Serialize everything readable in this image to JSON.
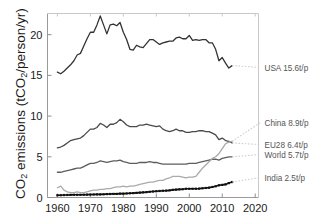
{
  "chart_data": {
    "type": "line",
    "title": "",
    "xlabel": "",
    "ylabel": "CO2 emissions (tCO2/person/yr)",
    "ylabel_parts": {
      "pre": "CO",
      "sub1": "2",
      "mid": " emissions (tCO",
      "sub2": "2",
      "post": "/person/yr)"
    },
    "xlim": [
      1957,
      2021
    ],
    "ylim": [
      0,
      22.6
    ],
    "xticks": [
      1960,
      1970,
      1980,
      1990,
      2000,
      2010,
      2020
    ],
    "yticks": [
      0,
      5,
      10,
      15,
      20
    ],
    "grid": false,
    "legend_position": "right-inline-labels",
    "series": [
      {
        "name": "USA",
        "label": "USA 15.6t/p",
        "color": "#333333",
        "end_value": 15.6,
        "x": [
          1960,
          1961,
          1962,
          1963,
          1964,
          1965,
          1966,
          1967,
          1968,
          1969,
          1970,
          1971,
          1972,
          1973,
          1974,
          1975,
          1976,
          1977,
          1978,
          1979,
          1980,
          1981,
          1982,
          1983,
          1984,
          1985,
          1986,
          1987,
          1988,
          1989,
          1990,
          1991,
          1992,
          1993,
          1994,
          1995,
          1996,
          1997,
          1998,
          1999,
          2000,
          2001,
          2002,
          2003,
          2004,
          2005,
          2006,
          2007,
          2008,
          2009,
          2010,
          2011,
          2012,
          2013
        ],
        "values": [
          15.4,
          15.2,
          15.5,
          15.9,
          16.3,
          16.8,
          17.5,
          17.7,
          18.6,
          19.5,
          20.3,
          20.3,
          21.2,
          22.3,
          21.2,
          20.1,
          21.2,
          21.3,
          21.1,
          21.5,
          20.3,
          19.4,
          18.2,
          18.1,
          18.7,
          18.5,
          18.4,
          18.9,
          19.4,
          19.4,
          19.1,
          18.8,
          19.0,
          19.1,
          19.2,
          19.2,
          19.6,
          19.7,
          19.5,
          19.5,
          19.9,
          19.3,
          19.4,
          19.3,
          19.4,
          19.4,
          19.0,
          19.0,
          18.2,
          16.8,
          17.2,
          16.5,
          15.9,
          16.2
        ]
      },
      {
        "name": "EU28",
        "label": "EU28 6.4t/p",
        "color": "#4a4a4a",
        "end_value": 6.4,
        "x": [
          1960,
          1961,
          1962,
          1963,
          1964,
          1965,
          1966,
          1967,
          1968,
          1969,
          1970,
          1971,
          1972,
          1973,
          1974,
          1975,
          1976,
          1977,
          1978,
          1979,
          1980,
          1981,
          1982,
          1983,
          1984,
          1985,
          1986,
          1987,
          1988,
          1989,
          1990,
          1991,
          1992,
          1993,
          1994,
          1995,
          1996,
          1997,
          1998,
          1999,
          2000,
          2001,
          2002,
          2003,
          2004,
          2005,
          2006,
          2007,
          2008,
          2009,
          2010,
          2011,
          2012,
          2013
        ],
        "values": [
          6.1,
          6.2,
          6.4,
          6.7,
          7.0,
          7.1,
          7.2,
          7.3,
          7.6,
          8.0,
          8.4,
          8.4,
          8.6,
          9.1,
          8.9,
          8.6,
          9.0,
          9.0,
          9.2,
          9.6,
          9.3,
          8.9,
          8.7,
          8.7,
          8.7,
          8.9,
          8.9,
          9.0,
          8.9,
          8.8,
          8.7,
          8.8,
          8.4,
          8.2,
          8.1,
          8.2,
          8.4,
          8.2,
          8.2,
          8.0,
          8.0,
          8.1,
          8.1,
          8.2,
          8.2,
          8.1,
          8.1,
          7.9,
          7.7,
          7.1,
          7.3,
          7.0,
          6.9,
          6.7
        ]
      },
      {
        "name": "World",
        "label": "World 5.7t/p",
        "color": "#5d5d5d",
        "end_value": 5.7,
        "x": [
          1960,
          1961,
          1962,
          1963,
          1964,
          1965,
          1966,
          1967,
          1968,
          1969,
          1970,
          1971,
          1972,
          1973,
          1974,
          1975,
          1976,
          1977,
          1978,
          1979,
          1980,
          1981,
          1982,
          1983,
          1984,
          1985,
          1986,
          1987,
          1988,
          1989,
          1990,
          1991,
          1992,
          1993,
          1994,
          1995,
          1996,
          1997,
          1998,
          1999,
          2000,
          2001,
          2002,
          2003,
          2004,
          2005,
          2006,
          2007,
          2008,
          2009,
          2010,
          2011,
          2012,
          2013
        ],
        "values": [
          3.1,
          3.1,
          3.2,
          3.3,
          3.4,
          3.5,
          3.6,
          3.6,
          3.8,
          4.0,
          4.2,
          4.2,
          4.3,
          4.5,
          4.4,
          4.3,
          4.4,
          4.5,
          4.5,
          4.6,
          4.4,
          4.3,
          4.2,
          4.2,
          4.2,
          4.3,
          4.3,
          4.3,
          4.4,
          4.3,
          4.3,
          4.2,
          4.1,
          4.1,
          4.1,
          4.1,
          4.1,
          4.1,
          4.1,
          4.1,
          4.2,
          4.2,
          4.2,
          4.3,
          4.4,
          4.5,
          4.6,
          4.7,
          4.7,
          4.6,
          4.8,
          4.9,
          5.0,
          5.0
        ]
      },
      {
        "name": "China",
        "label": "China 8.9t/p",
        "color": "#aaaaaa",
        "end_value": 8.9,
        "x": [
          1960,
          1961,
          1962,
          1963,
          1964,
          1965,
          1966,
          1967,
          1968,
          1969,
          1970,
          1971,
          1972,
          1973,
          1974,
          1975,
          1976,
          1977,
          1978,
          1979,
          1980,
          1981,
          1982,
          1983,
          1984,
          1985,
          1986,
          1987,
          1988,
          1989,
          1990,
          1991,
          1992,
          1993,
          1994,
          1995,
          1996,
          1997,
          1998,
          1999,
          2000,
          2001,
          2002,
          2003,
          2004,
          2005,
          2006,
          2007,
          2008,
          2009,
          2010,
          2011,
          2012,
          2013
        ],
        "values": [
          1.2,
          1.4,
          0.9,
          0.7,
          0.6,
          0.6,
          0.7,
          0.6,
          0.6,
          0.7,
          0.8,
          0.9,
          0.9,
          1.0,
          1.0,
          1.1,
          1.1,
          1.2,
          1.3,
          1.3,
          1.4,
          1.3,
          1.4,
          1.4,
          1.5,
          1.6,
          1.7,
          1.8,
          1.9,
          1.9,
          2.0,
          2.1,
          2.1,
          2.3,
          2.4,
          2.6,
          2.6,
          2.6,
          2.5,
          2.4,
          2.5,
          2.5,
          2.6,
          3.1,
          3.6,
          4.0,
          4.4,
          4.8,
          5.0,
          5.4,
          6.0,
          6.6,
          6.8,
          6.9
        ]
      },
      {
        "name": "India",
        "label": "India 2.5t/p",
        "color": "#111111",
        "end_value": 2.5,
        "markers": true,
        "x": [
          1960,
          1961,
          1962,
          1963,
          1964,
          1965,
          1966,
          1967,
          1968,
          1969,
          1970,
          1971,
          1972,
          1973,
          1974,
          1975,
          1976,
          1977,
          1978,
          1979,
          1980,
          1981,
          1982,
          1983,
          1984,
          1985,
          1986,
          1987,
          1988,
          1989,
          1990,
          1991,
          1992,
          1993,
          1994,
          1995,
          1996,
          1997,
          1998,
          1999,
          2000,
          2001,
          2002,
          2003,
          2004,
          2005,
          2006,
          2007,
          2008,
          2009,
          2010,
          2011,
          2012,
          2013
        ],
        "values": [
          0.27,
          0.28,
          0.3,
          0.31,
          0.32,
          0.33,
          0.33,
          0.33,
          0.34,
          0.35,
          0.36,
          0.37,
          0.38,
          0.38,
          0.39,
          0.42,
          0.43,
          0.44,
          0.44,
          0.47,
          0.47,
          0.5,
          0.52,
          0.54,
          0.57,
          0.6,
          0.63,
          0.66,
          0.7,
          0.74,
          0.77,
          0.8,
          0.83,
          0.85,
          0.88,
          0.94,
          0.97,
          1.0,
          1.02,
          1.07,
          1.07,
          1.07,
          1.08,
          1.09,
          1.13,
          1.17,
          1.21,
          1.29,
          1.38,
          1.5,
          1.55,
          1.61,
          1.77,
          1.9
        ]
      }
    ],
    "colors": {
      "usa": "#333333",
      "china": "#aaaaaa",
      "eu28": "#4a4a4a",
      "world": "#5d5d5d",
      "india": "#111111",
      "axis": "#9a9a9a",
      "text": "#1a1a1a",
      "legend_text": "#555555",
      "background": "#ffffff"
    }
  }
}
